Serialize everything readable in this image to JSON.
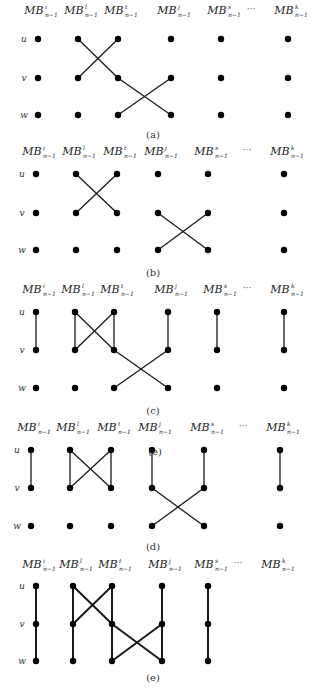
{
  "figure": {
    "column_names": [
      "i",
      "l",
      "t",
      "j",
      "s",
      "...",
      "k"
    ],
    "column_base": "MB",
    "column_subscript": "n−1",
    "row_names": [
      "u",
      "v",
      "w"
    ],
    "panels": [
      {
        "id": "a",
        "caption": "(a)",
        "caption_pos": [
          153,
          134
        ],
        "header_y": 14,
        "rows_y": [
          39,
          78,
          115
        ],
        "cols_x": {
          "i": 38,
          "l": 78,
          "t": 118,
          "j": 171,
          "s": 221,
          "k": 288
        },
        "ellipsis_x": 251,
        "dots": {
          "i": [
            "u",
            "v",
            "w"
          ],
          "l": [
            "u",
            "v",
            "w"
          ],
          "t": [
            "u",
            "v",
            "w"
          ],
          "j": [
            "u",
            "v",
            "w"
          ],
          "s": [
            "u",
            "v",
            "w"
          ],
          "k": [
            "u",
            "v",
            "w"
          ]
        },
        "edges": [
          [
            [
              "l",
              "u"
            ],
            [
              "t",
              "v"
            ]
          ],
          [
            [
              "t",
              "v"
            ],
            [
              "j",
              "w"
            ]
          ],
          [
            [
              "l",
              "v"
            ],
            [
              "t",
              "u"
            ]
          ],
          [
            [
              "t",
              "w"
            ],
            [
              "j",
              "v"
            ]
          ]
        ],
        "bold": false
      },
      {
        "id": "b",
        "caption": "(b)",
        "caption_pos": [
          153,
          272
        ],
        "header_y": 155,
        "rows_y": [
          174,
          213,
          250
        ],
        "cols_x": {
          "i": 36,
          "l": 76,
          "t": 117,
          "j": 158,
          "s": 208,
          "k": 284
        },
        "ellipsis_x": 247,
        "dots": {
          "i": [
            "u",
            "v",
            "w"
          ],
          "l": [
            "u",
            "v",
            "w"
          ],
          "t": [
            "u",
            "v",
            "w"
          ],
          "j": [
            "u",
            "v",
            "w"
          ],
          "s": [
            "u",
            "v",
            "w"
          ],
          "k": [
            "u",
            "v",
            "w"
          ]
        },
        "edges": [
          [
            [
              "l",
              "u"
            ],
            [
              "t",
              "v"
            ]
          ],
          [
            [
              "l",
              "v"
            ],
            [
              "t",
              "u"
            ]
          ],
          [
            [
              "j",
              "v"
            ],
            [
              "s",
              "w"
            ]
          ],
          [
            [
              "j",
              "w"
            ],
            [
              "s",
              "v"
            ]
          ]
        ],
        "bold": false
      },
      {
        "id": "c",
        "caption": "(c)",
        "caption_pos": [
          153,
          410
        ],
        "header_y": 293,
        "rows_y": [
          312,
          350,
          388
        ],
        "cols_x": {
          "i": 36,
          "l": 75,
          "t": 114,
          "j": 168,
          "s": 217,
          "k": 284
        },
        "ellipsis_x": 247,
        "dots": {
          "i": [
            "u",
            "v",
            "w"
          ],
          "l": [
            "u",
            "v",
            "w"
          ],
          "t": [
            "u",
            "v",
            "w"
          ],
          "j": [
            "u",
            "v",
            "w"
          ],
          "s": [
            "u",
            "v",
            "w"
          ],
          "k": [
            "u",
            "v",
            "w"
          ]
        },
        "edges": [
          [
            [
              "i",
              "u"
            ],
            [
              "i",
              "v"
            ]
          ],
          [
            [
              "l",
              "u"
            ],
            [
              "l",
              "v"
            ]
          ],
          [
            [
              "l",
              "v"
            ],
            [
              "t",
              "u"
            ]
          ],
          [
            [
              "t",
              "u"
            ],
            [
              "t",
              "v"
            ]
          ],
          [
            [
              "l",
              "u"
            ],
            [
              "t",
              "v"
            ]
          ],
          [
            [
              "t",
              "v"
            ],
            [
              "j",
              "w"
            ]
          ],
          [
            [
              "t",
              "w"
            ],
            [
              "j",
              "v"
            ]
          ],
          [
            [
              "j",
              "u"
            ],
            [
              "j",
              "v"
            ]
          ],
          [
            [
              "s",
              "u"
            ],
            [
              "s",
              "v"
            ]
          ],
          [
            [
              "k",
              "u"
            ],
            [
              "k",
              "v"
            ]
          ]
        ],
        "bold": false
      },
      {
        "id": "d",
        "caption": "(d)",
        "caption_pos": [
          153,
          546
        ],
        "header_y": 431,
        "rows_y": [
          450,
          488,
          526
        ],
        "cols_x": {
          "i": 31,
          "l": 70,
          "t": 111,
          "j": 152,
          "s": 204,
          "k": 280
        },
        "ellipsis_x": 243,
        "overlap_caption": {
          "text": "(e)",
          "pos": [
            155,
            451
          ]
        },
        "dots": {
          "i": [
            "u",
            "v",
            "w"
          ],
          "l": [
            "u",
            "v",
            "w"
          ],
          "t": [
            "u",
            "v",
            "w"
          ],
          "j": [
            "u",
            "v",
            "w"
          ],
          "s": [
            "u",
            "v",
            "w"
          ],
          "k": [
            "u",
            "v",
            "w"
          ]
        },
        "edges": [
          [
            [
              "i",
              "u"
            ],
            [
              "i",
              "v"
            ]
          ],
          [
            [
              "l",
              "u"
            ],
            [
              "l",
              "v"
            ]
          ],
          [
            [
              "l",
              "u"
            ],
            [
              "t",
              "v"
            ]
          ],
          [
            [
              "l",
              "v"
            ],
            [
              "t",
              "u"
            ]
          ],
          [
            [
              "t",
              "u"
            ],
            [
              "t",
              "v"
            ]
          ],
          [
            [
              "j",
              "u"
            ],
            [
              "j",
              "v"
            ]
          ],
          [
            [
              "j",
              "v"
            ],
            [
              "s",
              "w"
            ]
          ],
          [
            [
              "j",
              "w"
            ],
            [
              "s",
              "v"
            ]
          ],
          [
            [
              "s",
              "u"
            ],
            [
              "s",
              "v"
            ]
          ],
          [
            [
              "k",
              "u"
            ],
            [
              "k",
              "v"
            ]
          ]
        ],
        "bold": false
      },
      {
        "id": "e",
        "caption": "(e)",
        "caption_pos": [
          153,
          677
        ],
        "header_y": 568,
        "rows_y": [
          586,
          624,
          661
        ],
        "cols_x": {
          "i": 36,
          "l": 73,
          "t": 112,
          "j": 162,
          "s": 208,
          "k": 275
        },
        "ellipsis_x": 238,
        "dots": {
          "i": [
            "u",
            "v",
            "w"
          ],
          "l": [
            "u",
            "v",
            "w"
          ],
          "t": [
            "u",
            "v",
            "w"
          ],
          "j": [
            "u",
            "v",
            "w"
          ],
          "s": [
            "u",
            "v",
            "w"
          ]
        },
        "edges": [
          [
            [
              "i",
              "u"
            ],
            [
              "i",
              "w"
            ]
          ],
          [
            [
              "l",
              "u"
            ],
            [
              "l",
              "w"
            ]
          ],
          [
            [
              "t",
              "u"
            ],
            [
              "t",
              "w"
            ]
          ],
          [
            [
              "j",
              "u"
            ],
            [
              "j",
              "w"
            ]
          ],
          [
            [
              "s",
              "u"
            ],
            [
              "s",
              "w"
            ]
          ],
          [
            [
              "l",
              "u"
            ],
            [
              "t",
              "v"
            ]
          ],
          [
            [
              "t",
              "v"
            ],
            [
              "j",
              "w"
            ]
          ],
          [
            [
              "l",
              "v"
            ],
            [
              "t",
              "u"
            ]
          ],
          [
            [
              "t",
              "w"
            ],
            [
              "j",
              "v"
            ]
          ]
        ],
        "bold": true
      }
    ]
  }
}
